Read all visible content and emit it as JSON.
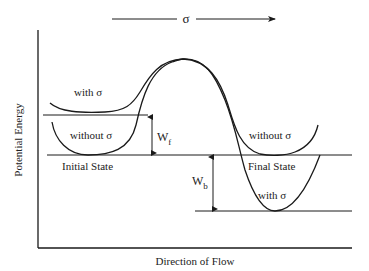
{
  "diagram": {
    "top_arrow": {
      "label": "σ"
    },
    "y_axis_label": "Potential Energy",
    "x_axis_label": "Direction of Flow",
    "labels": {
      "with_sigma_initial": "with  σ",
      "without_sigma_initial": "without  σ",
      "initial_state": "Initial State",
      "without_sigma_final": "without  σ",
      "final_state": "Final State",
      "with_sigma_final": "with  σ"
    },
    "wf": {
      "main": "W",
      "sub": "f"
    },
    "wb": {
      "main": "W",
      "sub": "b"
    },
    "colors": {
      "line": "#1a1a1a",
      "background": "#ffffff"
    }
  }
}
